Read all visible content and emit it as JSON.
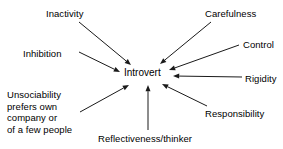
{
  "diagram": {
    "type": "radial-convergence",
    "center": {
      "label": "Introvert",
      "x": 124,
      "y": 67
    },
    "stroke_color": "#1a1a1a",
    "text_color": "#000000",
    "background_color": "#ffffff",
    "nodes": [
      {
        "id": "inactivity",
        "label": "Inactivity",
        "x": 46,
        "y": 8,
        "align": "left"
      },
      {
        "id": "carefulness",
        "label": "Carefulness",
        "x": 205,
        "y": 8,
        "align": "left"
      },
      {
        "id": "inhibition",
        "label": "Inhibition",
        "x": 23,
        "y": 48,
        "align": "left"
      },
      {
        "id": "control",
        "label": "Control",
        "x": 243,
        "y": 39,
        "align": "left"
      },
      {
        "id": "rigidity",
        "label": "Rigidity",
        "x": 245,
        "y": 73,
        "align": "left"
      },
      {
        "id": "responsibility",
        "label": "Responsibility",
        "x": 205,
        "y": 108,
        "align": "left"
      },
      {
        "id": "unsociability",
        "label": "Unsociability\nprefers own\ncompany or\nof a few people",
        "x": 7,
        "y": 89,
        "align": "left",
        "lines": [
          "Unsociability",
          "prefers own",
          "company or",
          "of a few people"
        ]
      },
      {
        "id": "reflectiveness",
        "label": "Reflectiveness/thinker",
        "x": 98,
        "y": 133,
        "align": "left"
      }
    ],
    "arrows": [
      {
        "id": "arrow-inactivity",
        "from": "inactivity",
        "to": "center",
        "x1": 79,
        "y1": 22,
        "x2": 131,
        "y2": 65
      },
      {
        "id": "arrow-carefulness",
        "from": "carefulness",
        "to": "center",
        "x1": 211,
        "y1": 22,
        "x2": 160,
        "y2": 64
      },
      {
        "id": "arrow-inhibition",
        "from": "inhibition",
        "to": "center",
        "x1": 79,
        "y1": 52,
        "x2": 120,
        "y2": 72
      },
      {
        "id": "arrow-control",
        "from": "control",
        "to": "center",
        "x1": 239,
        "y1": 45,
        "x2": 169,
        "y2": 70
      },
      {
        "id": "arrow-rigidity",
        "from": "rigidity",
        "to": "center",
        "x1": 242,
        "y1": 77,
        "x2": 173,
        "y2": 76
      },
      {
        "id": "arrow-responsibility",
        "from": "responsibility",
        "to": "center",
        "x1": 207,
        "y1": 106,
        "x2": 162,
        "y2": 84
      },
      {
        "id": "arrow-unsociability",
        "from": "unsociability",
        "to": "center",
        "x1": 80,
        "y1": 112,
        "x2": 129,
        "y2": 85
      },
      {
        "id": "arrow-reflectiveness",
        "from": "reflectiveness",
        "to": "center",
        "x1": 148,
        "y1": 130,
        "x2": 148,
        "y2": 85
      }
    ]
  }
}
